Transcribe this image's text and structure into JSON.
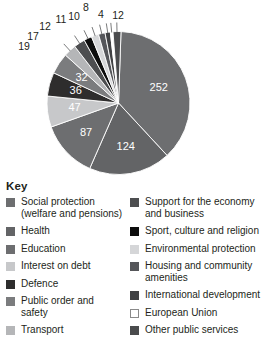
{
  "legend": {
    "title": "Key",
    "left_items": [
      {
        "label": "Social protection\n(welfare and pensions)",
        "color": "#6d6e70"
      },
      {
        "label": "Health",
        "color": "#636466"
      },
      {
        "label": "Education",
        "color": "#6d6e70"
      },
      {
        "label": "Interest on debt",
        "color": "#c7c8ca"
      },
      {
        "label": "Defence",
        "color": "#2e2d2d"
      },
      {
        "label": "Public order and\nsafety",
        "color": "#7b7c7e"
      },
      {
        "label": "Transport",
        "color": "#b5b6b8"
      }
    ],
    "right_items": [
      {
        "label": "Support for the economy\nand business",
        "color": "#4d4e50"
      },
      {
        "label": "Sport, culture and religion",
        "color": "#0d0d0d"
      },
      {
        "label": "Environmental protection",
        "color": "#d5d6d8"
      },
      {
        "label": "Housing and community\namenities",
        "color": "#55565a"
      },
      {
        "label": "International development",
        "color": "#414244"
      },
      {
        "label": "European Union",
        "color": "#ffffff"
      },
      {
        "label": "Other public services",
        "color": "#4a4b4d"
      }
    ]
  },
  "chart_data": {
    "type": "pie",
    "title": "",
    "total": 675,
    "units": "",
    "legend_position": "below",
    "grid": false,
    "categories": [
      "Social protection (welfare and pensions)",
      "Health",
      "Education",
      "Interest on debt",
      "Defence",
      "Public order and safety",
      "Transport",
      "Support for the economy and business",
      "Sport, culture and religion",
      "Environmental protection",
      "Housing and community amenities",
      "International development",
      "European Union",
      "Other public services"
    ],
    "values": [
      252,
      124,
      87,
      47,
      36,
      32,
      19,
      17,
      12,
      11,
      10,
      8,
      4,
      12
    ],
    "colors": [
      "#6d6e70",
      "#636466",
      "#6d6e70",
      "#c7c8ca",
      "#2e2d2d",
      "#7b7c7e",
      "#b5b6b8",
      "#4d4e50",
      "#0d0d0d",
      "#d5d6d8",
      "#55565a",
      "#414244",
      "#ffffff",
      "#4a4b4d"
    ],
    "inside_labels": [
      "252",
      "124",
      "87",
      "47",
      "36",
      "32"
    ],
    "callout_labels": [
      "19",
      "17",
      "12",
      "11",
      "10",
      "8",
      "4",
      "12"
    ]
  }
}
